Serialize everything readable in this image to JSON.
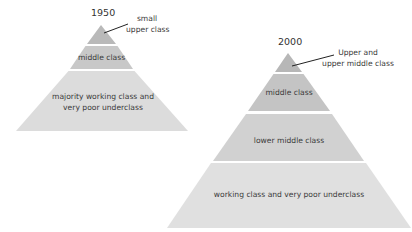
{
  "diagram": {
    "pyramid_1950": {
      "year": "1950",
      "tiers": [
        {
          "label": "small\nupper class",
          "color": "#b9b9b9"
        },
        {
          "label": "middle class",
          "color": "#c8c8c8"
        },
        {
          "label": "majority working class and\nvery poor underclass",
          "color": "#dcdcdc"
        }
      ],
      "callout_line1": "small",
      "callout_line2": "upper class",
      "middle_label": "middle class",
      "bottom_line1": "majority working class and",
      "bottom_line2": "very poor underclass"
    },
    "pyramid_2000": {
      "year": "2000",
      "tiers": [
        {
          "label": "Upper and\nupper middle class",
          "color": "#b7b7b7"
        },
        {
          "label": "middle class",
          "color": "#c4c4c4"
        },
        {
          "label": "lower middle class",
          "color": "#d1d1d1"
        },
        {
          "label": "working class and very poor underclass",
          "color": "#e0e0e0"
        }
      ],
      "callout_line1": "Upper and",
      "callout_line2": "upper middle class",
      "middle_label": "middle class",
      "lower_middle_label": "lower middle class",
      "bottom_label": "working class and very poor underclass"
    }
  }
}
